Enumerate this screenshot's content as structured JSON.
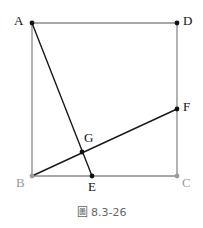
{
  "figure": {
    "caption": "圖 8.3-26",
    "caption_position": {
      "x": 0,
      "y": 206
    },
    "canvas": {
      "width": 203,
      "height": 228
    },
    "colors": {
      "square_stroke": "#8a8a8a",
      "segment_stroke": "#1a1a1a",
      "point_fill": "#111111",
      "point_fill_light": "#9a9a9a",
      "label_dark": "#111111",
      "label_light": "#9a9a9a",
      "caption_text": "#666666",
      "background": "#ffffff"
    },
    "points": [
      {
        "id": "A",
        "label": "A",
        "x": 32,
        "y": 23,
        "label_x": 14,
        "label_y": 14,
        "tone": "dark"
      },
      {
        "id": "D",
        "label": "D",
        "x": 177,
        "y": 23,
        "label_x": 183,
        "label_y": 14,
        "tone": "dark"
      },
      {
        "id": "F",
        "label": "F",
        "x": 177,
        "y": 109,
        "label_x": 183,
        "label_y": 100,
        "tone": "dark"
      },
      {
        "id": "G",
        "label": "G",
        "x": 82,
        "y": 152,
        "label_x": 84,
        "label_y": 131,
        "tone": "dark"
      },
      {
        "id": "B",
        "label": "B",
        "x": 32,
        "y": 176,
        "label_x": 16,
        "label_y": 176,
        "tone": "light"
      },
      {
        "id": "E",
        "label": "E",
        "x": 92,
        "y": 176,
        "label_x": 88,
        "label_y": 180,
        "tone": "dark"
      },
      {
        "id": "C",
        "label": "C",
        "x": 177,
        "y": 176,
        "label_x": 182,
        "label_y": 176,
        "tone": "light"
      }
    ],
    "square": {
      "name": "ABCD",
      "vertices": [
        "A",
        "D",
        "C",
        "B"
      ],
      "path": "M 32 23 L 177 23 L 177 176 L 32 176 Z",
      "stroke_width": 1.3
    },
    "segments": [
      {
        "id": "AE",
        "label": "A-E",
        "from": "A",
        "to": "E",
        "x1": 32,
        "y1": 23,
        "x2": 92,
        "y2": 176,
        "stroke_width": 1.4
      },
      {
        "id": "BF",
        "label": "B-F",
        "from": "B",
        "to": "F",
        "x1": 32,
        "y1": 176,
        "x2": 177,
        "y2": 109,
        "stroke_width": 1.4
      }
    ],
    "point_radius": 2.4
  }
}
